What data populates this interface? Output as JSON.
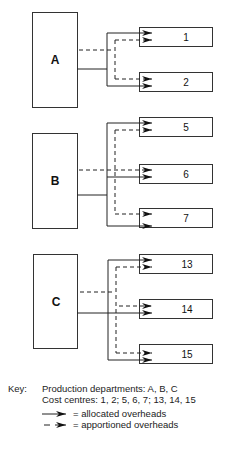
{
  "diagram": {
    "departments": [
      {
        "label": "A",
        "cost_centres": [
          "1",
          "2"
        ]
      },
      {
        "label": "B",
        "cost_centres": [
          "5",
          "6",
          "7"
        ]
      },
      {
        "label": "C",
        "cost_centres": [
          "13",
          "14",
          "15"
        ]
      }
    ]
  },
  "key": {
    "title": "Key:",
    "line1": "Production departments:   A, B, C",
    "line2": "Cost centres:   1, 2; 5, 6, 7; 13, 14, 15",
    "allocated": "= allocated overheads",
    "apportioned": "= apportioned overheads"
  }
}
